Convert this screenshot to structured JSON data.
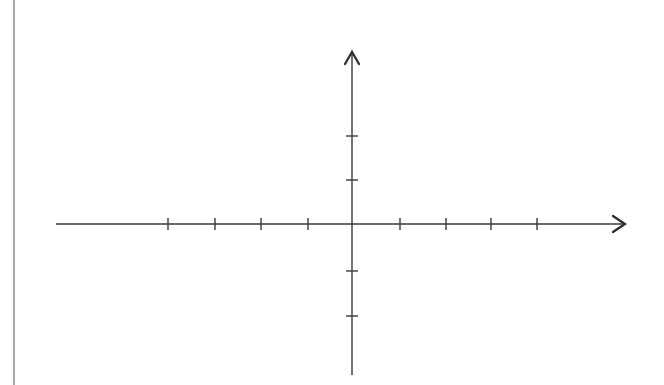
{
  "diagram": {
    "type": "cartesian-coordinate-axes",
    "colors": {
      "background": "#ffffff",
      "axis": "#3a3a3a",
      "border_line": "#8a8a8a"
    },
    "left_border_line": {
      "x": 14,
      "y1": 0,
      "y2": 385
    },
    "origin": {
      "x": 352,
      "y": 224
    },
    "x_axis": {
      "start_x": 56,
      "end_x": 625,
      "arrow": "right",
      "tick_positions": [
        168,
        215,
        261,
        308,
        400,
        446,
        491,
        537
      ],
      "tick_labels": []
    },
    "y_axis": {
      "start_y": 375,
      "end_y": 52,
      "arrow": "up",
      "tick_positions": [
        136,
        180,
        271,
        316
      ],
      "tick_labels": []
    },
    "tick_half_length": 6
  }
}
